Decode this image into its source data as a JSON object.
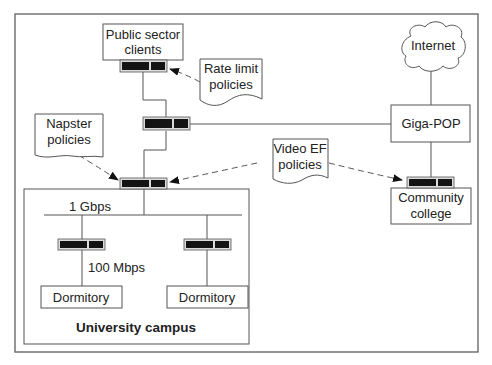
{
  "diagram": {
    "nodes": {
      "public_sector": {
        "line1": "Public sector",
        "line2": "clients"
      },
      "internet": {
        "label": "Internet"
      },
      "giga_pop": {
        "label": "Giga-POP"
      },
      "community_college": {
        "line1": "Community",
        "line2": "college"
      },
      "dorm_left": {
        "label": "Dormitory"
      },
      "dorm_right": {
        "label": "Dormitory"
      },
      "campus": {
        "label": "University campus"
      }
    },
    "policies": {
      "rate_limit": {
        "line1": "Rate limit",
        "line2": "policies"
      },
      "napster": {
        "line1": "Napster",
        "line2": "policies"
      },
      "video_ef": {
        "line1": "Video EF",
        "line2": "policies"
      }
    },
    "link_labels": {
      "backbone": "1 Gbps",
      "dorm_link": "100 Mbps"
    },
    "routers": [
      {
        "id": "router-public-sector"
      },
      {
        "id": "router-core"
      },
      {
        "id": "router-campus-edge"
      },
      {
        "id": "router-dorm-left"
      },
      {
        "id": "router-dorm-right"
      },
      {
        "id": "router-community-college"
      }
    ],
    "colors": {
      "stroke": "#555555",
      "router": "#141414",
      "background": "#ffffff"
    }
  }
}
